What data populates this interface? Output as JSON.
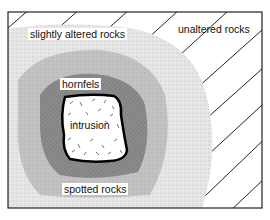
{
  "diagram": {
    "zones": [
      {
        "id": "intrusion",
        "label": "intrusion",
        "fill": "#ffffff"
      },
      {
        "id": "hornfels",
        "label": "hornfels",
        "fill": "#8a8a8a"
      },
      {
        "id": "spotted",
        "label": "spotted rocks",
        "fill": "#bdbdbd"
      },
      {
        "id": "slightly-altered",
        "label": "slightly altered rocks",
        "fill": "#e4e4e4"
      },
      {
        "id": "unaltered",
        "label": "unaltered rocks",
        "fill": "#ffffff"
      }
    ],
    "colors": {
      "frame": "#222222",
      "strata": "#222222",
      "intrusion_outline": "#000000"
    }
  }
}
